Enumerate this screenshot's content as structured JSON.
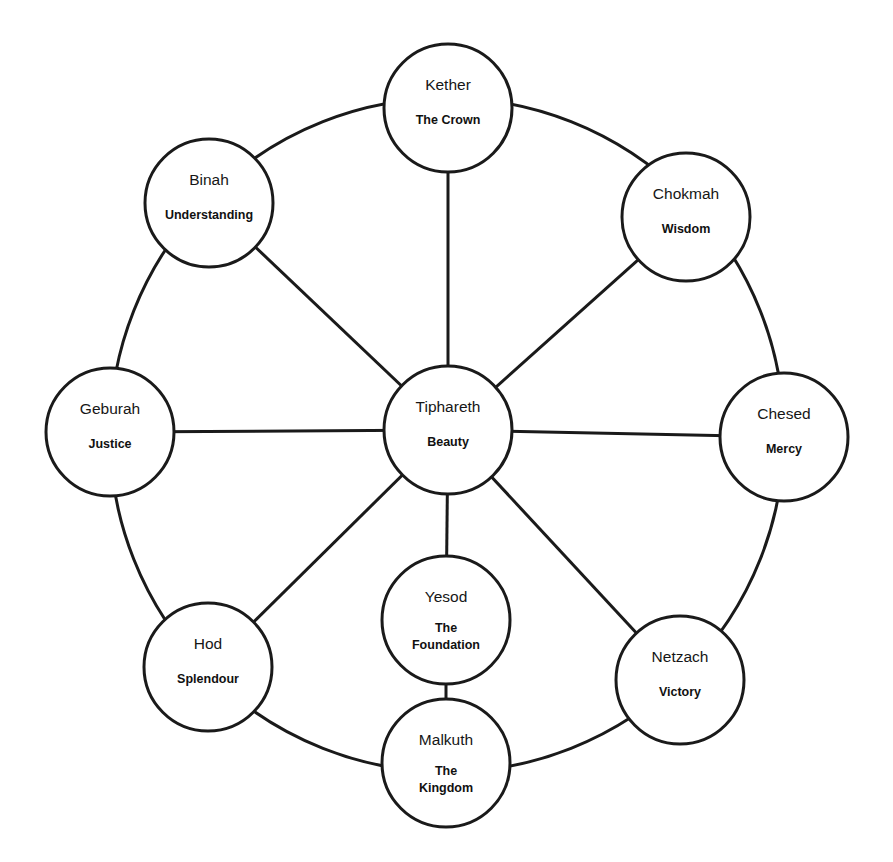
{
  "colors": {
    "background": "#ffffff",
    "stroke": "#1a1a1a",
    "text": "#161616"
  },
  "outer_ring": {
    "cx": 447,
    "cy": 435,
    "r": 337
  },
  "node_radius": 64,
  "nodes": [
    {
      "id": "kether",
      "name": "Kether",
      "meaning": [
        "The Crown"
      ],
      "cx": 448,
      "cy": 108
    },
    {
      "id": "chokmah",
      "name": "Chokmah",
      "meaning": [
        "Wisdom"
      ],
      "cx": 686,
      "cy": 217
    },
    {
      "id": "binah",
      "name": "Binah",
      "meaning": [
        "Understanding"
      ],
      "cx": 209,
      "cy": 203
    },
    {
      "id": "chesed",
      "name": "Chesed",
      "meaning": [
        "Mercy"
      ],
      "cx": 784,
      "cy": 437
    },
    {
      "id": "geburah",
      "name": "Geburah",
      "meaning": [
        "Justice"
      ],
      "cx": 110,
      "cy": 432
    },
    {
      "id": "tiphareth",
      "name": "Tiphareth",
      "meaning": [
        "Beauty"
      ],
      "cx": 448,
      "cy": 430
    },
    {
      "id": "netzach",
      "name": "Netzach",
      "meaning": [
        "Victory"
      ],
      "cx": 680,
      "cy": 680
    },
    {
      "id": "hod",
      "name": "Hod",
      "meaning": [
        "Splendour"
      ],
      "cx": 208,
      "cy": 667
    },
    {
      "id": "yesod",
      "name": "Yesod",
      "meaning": [
        "The",
        "Foundation"
      ],
      "cx": 446,
      "cy": 620
    },
    {
      "id": "malkuth",
      "name": "Malkuth",
      "meaning": [
        "The",
        "Kingdom"
      ],
      "cx": 446,
      "cy": 763
    }
  ],
  "connections": [
    [
      "tiphareth",
      "kether"
    ],
    [
      "tiphareth",
      "chokmah"
    ],
    [
      "tiphareth",
      "binah"
    ],
    [
      "tiphareth",
      "chesed"
    ],
    [
      "tiphareth",
      "geburah"
    ],
    [
      "tiphareth",
      "netzach"
    ],
    [
      "tiphareth",
      "hod"
    ],
    [
      "tiphareth",
      "yesod"
    ],
    [
      "yesod",
      "malkuth"
    ]
  ]
}
